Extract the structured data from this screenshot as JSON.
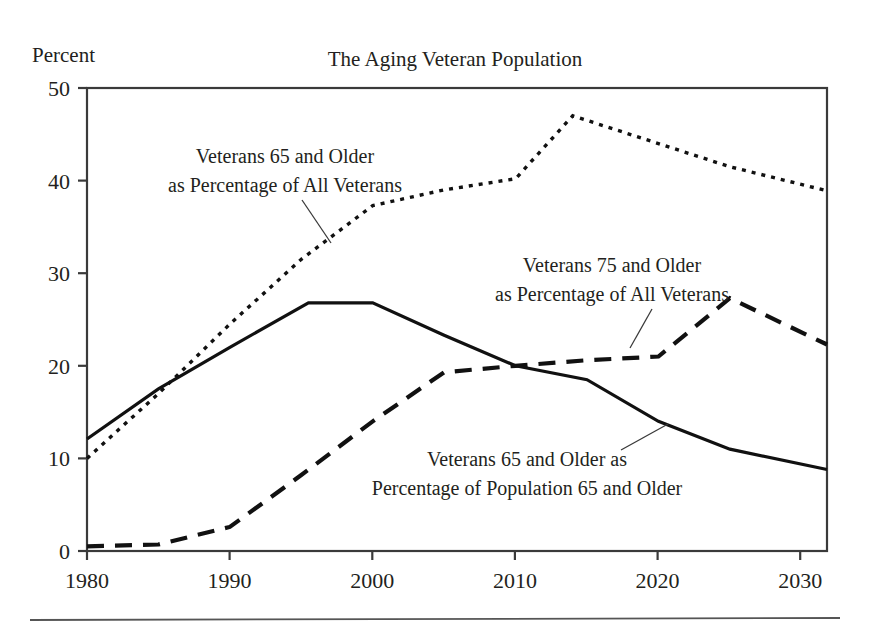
{
  "figure": {
    "title": "The Aging Veteran Population",
    "y_axis_caption": "Percent"
  },
  "annotations": {
    "series_a_line1": "Veterans 65 and Older",
    "series_a_line2": "as Percentage of All Veterans",
    "series_b_line1": "Veterans 75 and Older",
    "series_b_line2": "as Percentage of All Veterans",
    "series_c_line1": "Veterans 65 and Older as",
    "series_c_line2": "Percentage of Population 65 and Older"
  },
  "ticks": {
    "y": [
      "0",
      "10",
      "20",
      "30",
      "40",
      "50"
    ],
    "x": [
      "1980",
      "1990",
      "2000",
      "2010",
      "2020",
      "2030"
    ]
  },
  "chart_data": {
    "type": "line",
    "title": "The Aging Veteran Population",
    "xlabel": "",
    "ylabel": "Percent",
    "xlim": [
      1980,
      2031.8
    ],
    "ylim": [
      0,
      50
    ],
    "yticks": [
      0,
      10,
      20,
      30,
      40,
      50
    ],
    "xticks": [
      1980,
      1990,
      2000,
      2010,
      2020,
      2030
    ],
    "grid": false,
    "legend": "annotated-inline",
    "series": [
      {
        "name": "Veterans 65 and Older as Percentage of All Veterans",
        "style": "dotted",
        "x": [
          1980,
          1985,
          1990,
          1995,
          2000,
          2005,
          2010,
          2014,
          2020,
          2025,
          2031.8
        ],
        "values": [
          10.0,
          17.0,
          24.5,
          31.5,
          37.3,
          39.0,
          40.2,
          47.0,
          44.0,
          41.5,
          38.9
        ]
      },
      {
        "name": "Veterans 75 and Older as Percentage of All Veterans",
        "style": "dashed",
        "x": [
          1980,
          1985,
          1990,
          1995,
          2000,
          2005,
          2010,
          2015,
          2020,
          2025,
          2031.8
        ],
        "values": [
          0.5,
          0.7,
          2.6,
          8.2,
          14.0,
          19.3,
          20.0,
          20.6,
          21.0,
          27.3,
          22.3
        ]
      },
      {
        "name": "Veterans 65 and Older as Percentage of Population 65 and Older",
        "style": "solid",
        "x": [
          1980,
          1985,
          1990,
          1995.5,
          2000,
          2005,
          2010,
          2015,
          2020,
          2025,
          2031.8
        ],
        "values": [
          12.1,
          17.5,
          22.0,
          26.8,
          26.8,
          23.3,
          20.0,
          18.5,
          14.0,
          11.0,
          8.8
        ]
      }
    ]
  }
}
